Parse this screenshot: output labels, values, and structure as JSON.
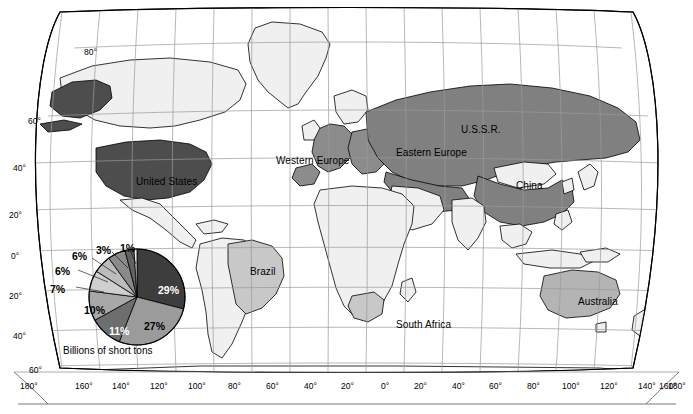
{
  "figure": {
    "type": "choropleth-map-with-pie-inset",
    "projection": "Robinson",
    "background_color": "#ffffff",
    "frame_color": "#000000"
  },
  "map": {
    "title": "",
    "country_labels": [
      {
        "name": "United States",
        "label": "United States",
        "x": 136,
        "y": 176,
        "fill": "#4d4d4d",
        "text_color": "#000000"
      },
      {
        "name": "Brazil",
        "label": "Brazil",
        "x": 250,
        "y": 266,
        "fill": "#c8c8c8",
        "text_color": "#000000"
      },
      {
        "name": "Western Europe",
        "label": "Western Europe",
        "x": 276,
        "y": 155,
        "fill": "#8c8c8c",
        "text_color": "#000000"
      },
      {
        "name": "Eastern Europe",
        "label": "Eastern Europe",
        "x": 396,
        "y": 147,
        "fill": "#8c8c8c",
        "text_color": "#000000"
      },
      {
        "name": "U.S.S.R.",
        "label": "U.S.S.R.",
        "x": 461,
        "y": 124,
        "fill": "#808080",
        "text_color": "#000000"
      },
      {
        "name": "China",
        "label": "China",
        "x": 516,
        "y": 180,
        "fill": "#808080",
        "text_color": "#000000"
      },
      {
        "name": "South Africa",
        "label": "South Africa",
        "x": 396,
        "y": 319,
        "fill": "#c8c8c8",
        "text_color": "#000000"
      },
      {
        "name": "Australia",
        "label": "Australia",
        "x": 578,
        "y": 296,
        "fill": "#b4b4b4",
        "text_color": "#000000"
      }
    ],
    "latitude_labels": [
      {
        "label": "80°",
        "x": 84,
        "y": 47
      },
      {
        "label": "60°",
        "x": 28,
        "y": 116
      },
      {
        "label": "40°",
        "x": 13,
        "y": 163
      },
      {
        "label": "20°",
        "x": 9,
        "y": 210
      },
      {
        "label": "0°",
        "x": 11,
        "y": 251
      },
      {
        "label": "20°",
        "x": 9,
        "y": 291
      },
      {
        "label": "40°",
        "x": 13,
        "y": 331
      },
      {
        "label": "60°",
        "x": 29,
        "y": 365
      }
    ],
    "longitude_labels": [
      {
        "label": "180°",
        "x": 20,
        "y": 381
      },
      {
        "label": "160°",
        "x": 75,
        "y": 381
      },
      {
        "label": "140°",
        "x": 112,
        "y": 381
      },
      {
        "label": "120°",
        "x": 150,
        "y": 381
      },
      {
        "label": "100°",
        "x": 188,
        "y": 381
      },
      {
        "label": "80°",
        "x": 228,
        "y": 381
      },
      {
        "label": "60°",
        "x": 266,
        "y": 381
      },
      {
        "label": "40°",
        "x": 304,
        "y": 381
      },
      {
        "label": "20°",
        "x": 341,
        "y": 381
      },
      {
        "label": "0°",
        "x": 381,
        "y": 381
      },
      {
        "label": "20°",
        "x": 414,
        "y": 381
      },
      {
        "label": "40°",
        "x": 452,
        "y": 381
      },
      {
        "label": "60°",
        "x": 489,
        "y": 381
      },
      {
        "label": "80°",
        "x": 527,
        "y": 381
      },
      {
        "label": "100°",
        "x": 562,
        "y": 381
      },
      {
        "label": "120°",
        "x": 600,
        "y": 381
      },
      {
        "label": "140°",
        "x": 638,
        "y": 381
      },
      {
        "label": "160°",
        "x": 659,
        "y": 381
      },
      {
        "label": "180°",
        "x": 668,
        "y": 381
      }
    ]
  },
  "chart_data": {
    "type": "pie",
    "title": "Billions of short tons",
    "xlabel": "",
    "ylabel": "",
    "center": {
      "x": 137,
      "y": 297
    },
    "radius": 48,
    "start_angle_deg": 0,
    "direction": "clockwise",
    "categories": [
      "29%",
      "27%",
      "11%",
      "10%",
      "7%",
      "6%",
      "6%",
      "3%",
      "1%"
    ],
    "values": [
      29,
      27,
      11,
      10,
      7,
      6,
      6,
      3,
      1
    ],
    "labels": [
      "29%",
      "27%",
      "11%",
      "10%",
      "7%",
      "6%",
      "6%",
      "3%",
      "1%"
    ],
    "colors": [
      "#3d3d3d",
      "#9b9b9b",
      "#6e6e6e",
      "#a8a8a8",
      "#cfcfcf",
      "#bcbcbc",
      "#8a8a8a",
      "#626262",
      "#ededed"
    ],
    "label_placements": [
      {
        "label": "29%",
        "x": 158,
        "y": 284,
        "inside": true,
        "color": "#ffffff"
      },
      {
        "label": "27%",
        "x": 144,
        "y": 320,
        "inside": true,
        "color": "#000000"
      },
      {
        "label": "11%",
        "x": 109,
        "y": 325,
        "inside": true,
        "color": "#ffffff"
      },
      {
        "label": "10%",
        "x": 84,
        "y": 304,
        "inside": true,
        "color": "#000000"
      },
      {
        "label": "7%",
        "x": 50,
        "y": 283,
        "inside": false,
        "color": "#000000"
      },
      {
        "label": "6%",
        "x": 55,
        "y": 265,
        "inside": false,
        "color": "#000000"
      },
      {
        "label": "6%",
        "x": 72,
        "y": 250,
        "inside": false,
        "color": "#000000"
      },
      {
        "label": "3%",
        "x": 96,
        "y": 244,
        "inside": false,
        "color": "#000000"
      },
      {
        "label": "1%",
        "x": 120,
        "y": 242,
        "inside": false,
        "color": "#000000"
      }
    ],
    "legend_position": "none",
    "grid": false
  }
}
